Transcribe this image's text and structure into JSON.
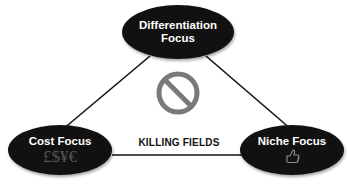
{
  "diagram": {
    "nodes": {
      "top": {
        "line1": "Differentiation",
        "line2": "Focus"
      },
      "left": {
        "label": "Cost Focus",
        "symbols": "£$¥€"
      },
      "right": {
        "label": "Niche Focus",
        "icon": "thumbs-up-icon"
      }
    },
    "center": {
      "icon": "prohibition-icon",
      "label": "KILLING FIELDS"
    },
    "colors": {
      "node_fill": "#111111",
      "node_text": "#ffffff",
      "line": "#111111",
      "symbol_gray": "#7a7a7a"
    }
  }
}
